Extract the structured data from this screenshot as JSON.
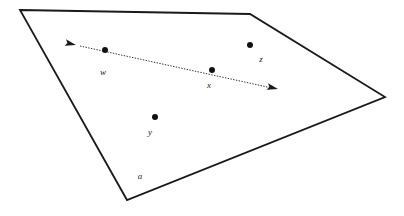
{
  "figure": {
    "background_color": "#ffffff",
    "stroke_color": "#1a1a1a",
    "width": 404,
    "height": 216
  },
  "region": {
    "label": "a",
    "label_x": 140,
    "label_y": 179,
    "fill": "#ffffff",
    "stroke": "#1a1a1a",
    "stroke_width": 1.8,
    "vertices": [
      {
        "name": "top-left",
        "x": 20,
        "y": 10
      },
      {
        "name": "top-right",
        "x": 250,
        "y": 14
      },
      {
        "name": "right",
        "x": 385,
        "y": 97
      },
      {
        "name": "bottom",
        "x": 127,
        "y": 200
      }
    ],
    "points_path": "20,10 250,14 385,97 127,200"
  },
  "line": {
    "name": "dotted-double-arrow",
    "stroke": "#1a1a1a",
    "stroke_width": 0.9,
    "dash_pattern": "1.4 1.4",
    "x1": 80,
    "y1": 46,
    "x2": 272,
    "y2": 88,
    "arrowhead_start": {
      "x": 76,
      "y": 45,
      "angle": -167
    },
    "arrowhead_end": {
      "x": 278,
      "y": 89,
      "angle": 13
    }
  },
  "points": [
    {
      "id": "w",
      "label": "w",
      "x": 105,
      "y": 50,
      "r": 3.0,
      "label_x": 103,
      "label_y": 75,
      "on_line": true
    },
    {
      "id": "x",
      "label": "x",
      "x": 212,
      "y": 70,
      "r": 3.0,
      "label_x": 209,
      "label_y": 88,
      "on_line": true
    },
    {
      "id": "y",
      "label": "y",
      "x": 155,
      "y": 117,
      "r": 3.0,
      "label_x": 150,
      "label_y": 135,
      "on_line": false
    },
    {
      "id": "z",
      "label": "z",
      "x": 250,
      "y": 45,
      "r": 3.0,
      "label_x": 261,
      "label_y": 62,
      "on_line": false
    }
  ]
}
